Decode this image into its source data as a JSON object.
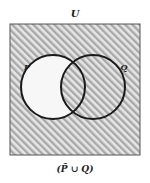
{
  "diagram": {
    "type": "venn",
    "universe_label": "U",
    "sets": [
      {
        "label": "P",
        "cx": 53,
        "cy": 87,
        "r": 32
      },
      {
        "label": "Q",
        "cx": 93,
        "cy": 87,
        "r": 32
      }
    ],
    "caption": "(P̃ ∪ Q)",
    "shaded_region": "complement of P union Q",
    "colors": {
      "hatch_stripe": "#a8a8a8",
      "hatch_background": "#e6e6e6",
      "outline": "#1a1a1a",
      "unshaded": "#f7f7f7"
    }
  }
}
